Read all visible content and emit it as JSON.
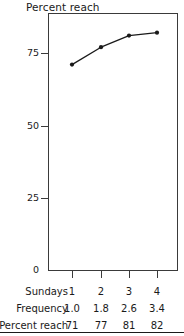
{
  "chart_data": {
    "type": "line",
    "title": "Percent reach",
    "xlabel": "",
    "ylabel": "",
    "categories": [
      "1",
      "2",
      "3",
      "4"
    ],
    "x": [
      1,
      2,
      3,
      4
    ],
    "values": [
      71,
      77,
      81,
      82
    ],
    "series": [
      {
        "name": "Percent reach",
        "values": [
          71,
          77,
          81,
          82
        ]
      }
    ],
    "ylim": [
      0,
      100
    ],
    "yticks": [
      0,
      25,
      50,
      75
    ],
    "ytick_labels": [
      "0",
      "25",
      "50",
      "75"
    ],
    "xtick_labels": [
      "1",
      "2",
      "3",
      "4"
    ],
    "grid": false,
    "legend": "none",
    "marker": "filled-circle",
    "line_color": "#1a1a1a",
    "marker_color": "#1a1a1a",
    "frame_color": "#3a3a3a",
    "background": "#ffffff"
  },
  "table": {
    "rows": [
      {
        "label": "Sundays",
        "cells": [
          "1",
          "2",
          "3",
          "4"
        ]
      },
      {
        "label": "Frequency",
        "cells": [
          "1.0",
          "1.8",
          "2.6",
          "3.4"
        ]
      },
      {
        "label": "Percent reach",
        "cells": [
          "71",
          "77",
          "81",
          "82"
        ]
      }
    ]
  },
  "axis": {
    "y_labels": [
      "75",
      "50",
      "25",
      "0"
    ]
  }
}
